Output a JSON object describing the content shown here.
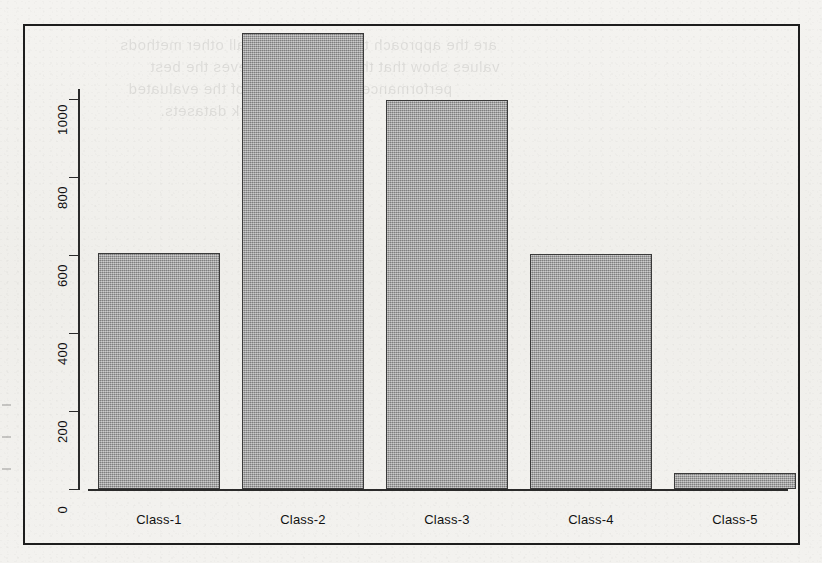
{
  "chart_data": {
    "type": "bar",
    "title": "",
    "xlabel": "",
    "ylabel": "",
    "categories": [
      "Class-1",
      "Class-2",
      "Class-3",
      "Class-4",
      "Class-5"
    ],
    "values": [
      606,
      1168,
      997,
      603,
      40
    ],
    "ylim": [
      0,
      1200
    ],
    "yticks": [
      0,
      200,
      400,
      600,
      800,
      1000
    ],
    "ytick_labels": [
      "0",
      "200",
      "400",
      "600",
      "800",
      "1000"
    ],
    "grid": false,
    "legend": null,
    "bar_color": "#9a9a9a",
    "bar_border_color": "#3a3a3a",
    "axis_color": "#2a2a2a",
    "background_color": "#f2f1ee",
    "frame_color": "#1d1d1d",
    "ytick_label_rotation": 90
  },
  "ghost_text": {
    "line1": "are the approach that outperforms all other methods",
    "line2": "values show that the classifier achieves the best",
    "line3": "performance on the majority of the evaluated",
    "line4": "benchmark datasets."
  }
}
